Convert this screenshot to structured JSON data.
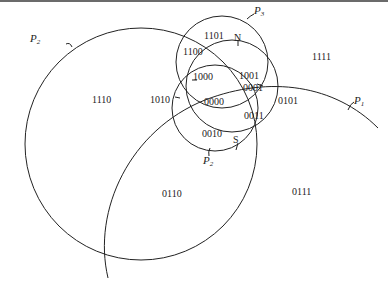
{
  "diagram": {
    "type": "venn-region-coding",
    "curves": [
      {
        "id": "P1",
        "label": "P",
        "subscript": "1",
        "shape": "large-arc"
      },
      {
        "id": "P2-large",
        "label": "P",
        "subscript": "2",
        "shape": "large-circle"
      },
      {
        "id": "P2-small",
        "label": "P",
        "subscript": "2",
        "shape": "circle",
        "marker": "S"
      },
      {
        "id": "P3",
        "label": "P",
        "subscript": "3",
        "shape": "circle"
      },
      {
        "id": "N-circle",
        "marker": "N",
        "shape": "circle"
      }
    ],
    "markers": {
      "north": "N",
      "south": "S"
    },
    "regions": {
      "r1101": "1101",
      "r1100": "1100",
      "r1000": "1000",
      "r1001": "1001",
      "r0001": "0001",
      "r0000": "0000",
      "r0101": "0101",
      "r1010": "1010",
      "r1110": "1110",
      "r0011": "0011",
      "r0010": "0010",
      "r0110": "0110",
      "r0111": "0111",
      "r1111": "1111"
    },
    "colors": {
      "stroke": "#222222",
      "background": "#ffffff"
    }
  }
}
